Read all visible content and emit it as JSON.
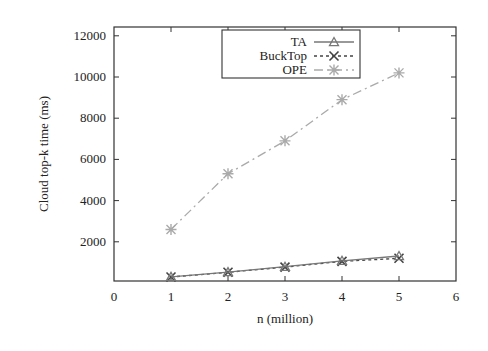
{
  "chart_data": {
    "type": "line",
    "title": "",
    "xlabel": "n (million)",
    "ylabel": "Cloud top-k time (ms)",
    "x": [
      1,
      2,
      3,
      4,
      5
    ],
    "xlim": [
      0,
      6
    ],
    "ylim": [
      300,
      12400
    ],
    "xticks": [
      0,
      1,
      2,
      3,
      4,
      5,
      6
    ],
    "yticks": [
      2000,
      4000,
      6000,
      8000,
      10000,
      12000
    ],
    "grid": false,
    "legend_position": "top-center (inside, boxed)",
    "series": [
      {
        "name": "TA",
        "marker": "triangle",
        "line": "solid",
        "color": "#777777",
        "values": [
          300,
          530,
          790,
          1080,
          1310
        ]
      },
      {
        "name": "BuckTop",
        "marker": "x",
        "line": "dashed",
        "color": "#444444",
        "values": [
          290,
          520,
          770,
          1050,
          1200
        ]
      },
      {
        "name": "OPE",
        "marker": "asterisk",
        "line": "dash-dot",
        "color": "#aaaaaa",
        "values": [
          2600,
          5300,
          6900,
          8900,
          10200
        ]
      }
    ]
  },
  "legend": {
    "items": [
      {
        "label": "TA"
      },
      {
        "label": "BuckTop"
      },
      {
        "label": "OPE"
      }
    ]
  },
  "axes": {
    "x_label": "n (million)",
    "y_label": "Cloud top-k time (ms)",
    "x_tick_labels": [
      "0",
      "1",
      "2",
      "3",
      "4",
      "5",
      "6"
    ],
    "y_tick_labels": [
      "2000",
      "4000",
      "6000",
      "8000",
      "10000",
      "12000"
    ]
  }
}
